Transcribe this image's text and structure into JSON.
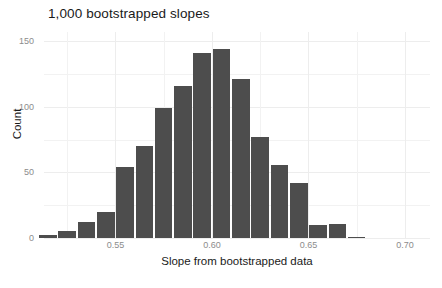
{
  "chart_data": {
    "type": "bar",
    "title": "1,000 bootstrapped slopes",
    "xlabel": "Slope from bootstrapped data",
    "ylabel": "Count",
    "grid": true,
    "legend": "none",
    "xlim": [
      0.513,
      0.713
    ],
    "ylim": [
      0,
      157
    ],
    "bin_width": 0.01,
    "x_ticks": [
      0.55,
      0.6,
      0.65,
      0.7
    ],
    "x_tick_labels": [
      "0.55",
      "0.60",
      "0.65",
      "0.70"
    ],
    "y_ticks": [
      0,
      50,
      100,
      150
    ],
    "y_tick_labels": [
      "0",
      "50",
      "100",
      "150"
    ],
    "bar_color": "#4d4d4d",
    "categories": [
      "0.515",
      "0.525",
      "0.535",
      "0.545",
      "0.555",
      "0.565",
      "0.575",
      "0.585",
      "0.595",
      "0.605",
      "0.615",
      "0.625",
      "0.635",
      "0.645",
      "0.655",
      "0.665",
      "0.675",
      "0.685"
    ],
    "bin_centers": [
      0.515,
      0.525,
      0.535,
      0.545,
      0.555,
      0.565,
      0.575,
      0.585,
      0.595,
      0.605,
      0.615,
      0.625,
      0.635,
      0.645,
      0.655,
      0.665,
      0.675,
      0.685
    ],
    "values": [
      2,
      5,
      12,
      20,
      54,
      70,
      99,
      116,
      141,
      144,
      121,
      77,
      56,
      42,
      10,
      11,
      1,
      0
    ]
  }
}
